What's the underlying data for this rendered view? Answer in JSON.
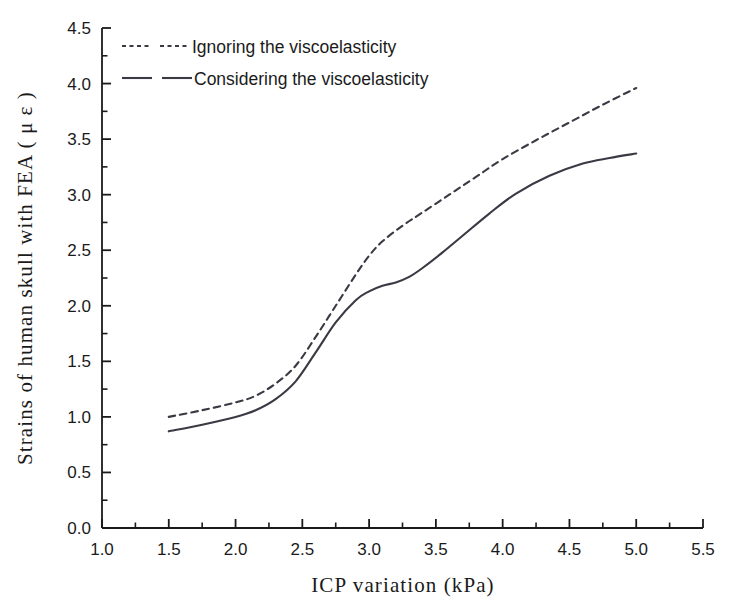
{
  "chart_data": {
    "type": "line",
    "title": "",
    "xlabel": "ICP variation (kPa)",
    "ylabel": "Strains of human skull with FEA ( μ ε )",
    "xlim": [
      1.0,
      5.5
    ],
    "ylim": [
      0.0,
      4.5
    ],
    "xticks": [
      "1.0",
      "1.5",
      "2.0",
      "2.5",
      "3.0",
      "3.5",
      "4.0",
      "4.5",
      "5.0",
      "5.5"
    ],
    "xtick_values": [
      1.0,
      1.5,
      2.0,
      2.5,
      3.0,
      3.5,
      4.0,
      4.5,
      5.0,
      5.5
    ],
    "yticks": [
      "0.0",
      "0.5",
      "1.0",
      "1.5",
      "2.0",
      "2.5",
      "3.0",
      "3.5",
      "4.0",
      "4.5"
    ],
    "ytick_values": [
      0.0,
      0.5,
      1.0,
      1.5,
      2.0,
      2.5,
      3.0,
      3.5,
      4.0,
      4.5
    ],
    "minor_ticks": true,
    "grid": false,
    "legend_position": "top-left-inside",
    "series": [
      {
        "name": "Ignoring the viscoelasticity",
        "style": "dashed",
        "color": "#3a3a44",
        "x": [
          1.5,
          1.75,
          2.0,
          2.15,
          2.3,
          2.45,
          2.6,
          2.75,
          2.9,
          3.0,
          3.1,
          3.25,
          3.4,
          3.6,
          3.8,
          4.0,
          4.25,
          4.5,
          4.75,
          5.0
        ],
        "values": [
          1.0,
          1.06,
          1.13,
          1.19,
          1.3,
          1.46,
          1.72,
          2.0,
          2.28,
          2.45,
          2.58,
          2.72,
          2.84,
          3.0,
          3.16,
          3.32,
          3.49,
          3.65,
          3.81,
          3.96
        ]
      },
      {
        "name": "Considering the viscoelasticity",
        "style": "solid",
        "color": "#3a3a44",
        "x": [
          1.5,
          1.75,
          2.0,
          2.15,
          2.3,
          2.45,
          2.6,
          2.75,
          2.9,
          3.0,
          3.1,
          3.2,
          3.3,
          3.4,
          3.55,
          3.7,
          3.9,
          4.1,
          4.35,
          4.6,
          4.8,
          5.0
        ],
        "values": [
          0.87,
          0.93,
          1.0,
          1.06,
          1.16,
          1.32,
          1.58,
          1.85,
          2.05,
          2.13,
          2.18,
          2.21,
          2.26,
          2.34,
          2.48,
          2.63,
          2.83,
          3.01,
          3.17,
          3.28,
          3.33,
          3.37
        ]
      }
    ]
  },
  "legend": {
    "entries": [
      {
        "label": "Ignoring the viscoelasticity",
        "style": "dashed"
      },
      {
        "label": "Considering the viscoelasticity",
        "style": "solid"
      }
    ]
  },
  "axes": {
    "x_title": "ICP variation (kPa)",
    "y_title": "Strains of human skull with FEA ( μ ε )"
  },
  "colors": {
    "line": "#3a3a44",
    "axis": "#1a1a1a",
    "background": "#ffffff"
  }
}
